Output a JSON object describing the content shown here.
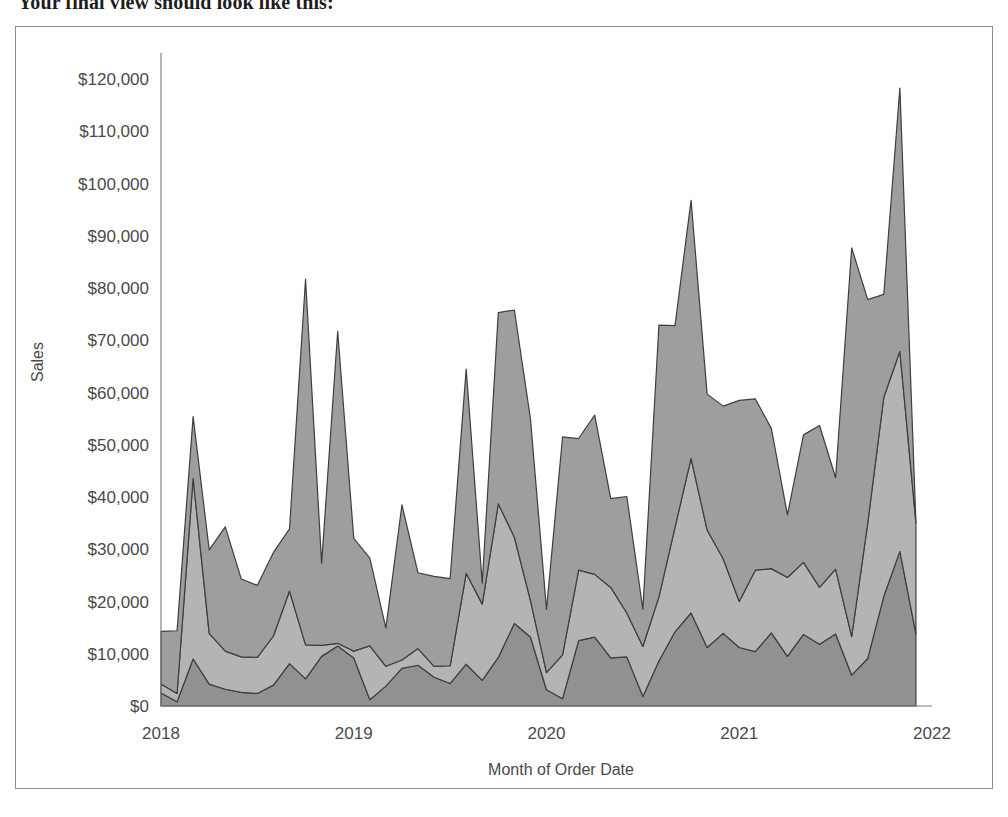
{
  "document": {
    "heading": "Your final view should look like this:"
  },
  "viz": {
    "frame_border_color": "#8d8d8d",
    "background": "#ffffff"
  },
  "chart_data": {
    "type": "area",
    "stacked": true,
    "title": "",
    "xlabel": "Month of Order Date",
    "ylabel": "Sales",
    "ylim": [
      0,
      125000
    ],
    "ytick_values": [
      0,
      10000,
      20000,
      30000,
      40000,
      50000,
      60000,
      70000,
      80000,
      90000,
      100000,
      110000,
      120000
    ],
    "ytick_labels": [
      "$0",
      "$10,000",
      "$20,000",
      "$30,000",
      "$40,000",
      "$50,000",
      "$60,000",
      "$70,000",
      "$80,000",
      "$90,000",
      "$100,000",
      "$110,000",
      "$120,000"
    ],
    "xtick_labels": [
      "2018",
      "2019",
      "2020",
      "2021",
      "2022"
    ],
    "xtick_positions": [
      0,
      12,
      24,
      36,
      48
    ],
    "x_count": 48,
    "grid": false,
    "legend": "none",
    "colors": {
      "series_1": "#919191",
      "series_2": "#b4b4b4",
      "series_3": "#9e9e9e",
      "outline": "#3e3e3e",
      "axis": "#7a7a7a",
      "text": "#4a4a4a"
    },
    "x": [
      "2018-01",
      "2018-02",
      "2018-03",
      "2018-04",
      "2018-05",
      "2018-06",
      "2018-07",
      "2018-08",
      "2018-09",
      "2018-10",
      "2018-11",
      "2018-12",
      "2019-01",
      "2019-02",
      "2019-03",
      "2019-04",
      "2019-05",
      "2019-06",
      "2019-07",
      "2019-08",
      "2019-09",
      "2019-10",
      "2019-11",
      "2019-12",
      "2020-01",
      "2020-02",
      "2020-03",
      "2020-04",
      "2020-05",
      "2020-06",
      "2020-07",
      "2020-08",
      "2020-09",
      "2020-10",
      "2020-11",
      "2020-12",
      "2021-01",
      "2021-02",
      "2021-03",
      "2021-04",
      "2021-05",
      "2021-06",
      "2021-07",
      "2021-08",
      "2021-09",
      "2021-10",
      "2021-11",
      "2021-12"
    ],
    "series": [
      {
        "name": "Series 1",
        "color": "#919191",
        "values": [
          2500,
          800,
          9000,
          4200,
          3200,
          2600,
          2400,
          4000,
          8100,
          5200,
          9500,
          11500,
          9200,
          1200,
          3800,
          7200,
          7800,
          5500,
          4300,
          8000,
          4900,
          9300,
          15800,
          13200,
          3100,
          1400,
          12500,
          13200,
          9200,
          9400,
          1800,
          8600,
          14200,
          17800,
          11200,
          13900,
          11200,
          10400,
          14000,
          9500,
          13700,
          11800,
          13800,
          5900,
          9100,
          21000,
          29600,
          13800
        ]
      },
      {
        "name": "Series 2",
        "color": "#b4b4b4",
        "values": [
          1700,
          1600,
          34600,
          9700,
          7300,
          6800,
          6900,
          9400,
          13900,
          6500,
          2100,
          500,
          1300,
          10300,
          3800,
          1600,
          3200,
          2100,
          3400,
          17400,
          14600,
          29400,
          16500,
          7000,
          3300,
          8400,
          13500,
          12000,
          13500,
          8400,
          9600,
          12300,
          20000,
          29600,
          22500,
          14300,
          8800,
          15600,
          12300,
          15100,
          13800,
          10900,
          12400,
          7400,
          25900,
          38100,
          38300,
          21300
        ]
      },
      {
        "name": "Series 3",
        "color": "#9e9e9e",
        "values": [
          10100,
          12000,
          11800,
          16000,
          23800,
          14900,
          13800,
          16000,
          11900,
          70000,
          15700,
          59700,
          21600,
          16800,
          7300,
          29700,
          14500,
          17200,
          16700,
          39100,
          4000,
          36600,
          43500,
          34800,
          12100,
          41700,
          25200,
          30500,
          17000,
          22300,
          7100,
          52000,
          38600,
          49400,
          26000,
          29200,
          38500,
          32800,
          26800,
          12000,
          24400,
          31000,
          17500,
          74400,
          42800,
          19700,
          50400,
          0
        ]
      }
    ]
  }
}
